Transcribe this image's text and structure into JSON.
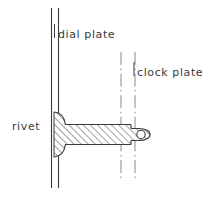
{
  "diagram": {
    "background_color": "#ffffff",
    "line_color": "#3a3a3a",
    "hatch_color": "#555555",
    "labels": {
      "dial_plate": "dial plate",
      "clock_plate": "clock plate",
      "rivet": "rivet"
    },
    "parts": [
      {
        "name": "dial-plate",
        "style": "solid",
        "description": "two parallel solid vertical lines"
      },
      {
        "name": "clock-plate",
        "style": "dash-dot",
        "description": "two parallel dash-dot vertical lines"
      },
      {
        "name": "rivet",
        "style": "hatched-section",
        "description": "mushroom head at left, hatched shaft, rounded tang with hole at right"
      }
    ]
  }
}
